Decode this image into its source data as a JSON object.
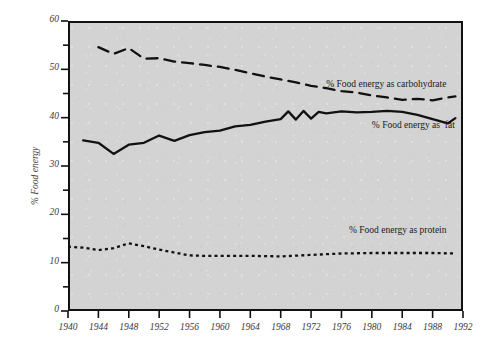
{
  "chart_data": {
    "type": "line",
    "title": "",
    "xlabel": "",
    "ylabel": "% Food energy",
    "xlim": [
      1940,
      1992
    ],
    "ylim": [
      0,
      60
    ],
    "grid": false,
    "legend_position": "inline-annotations",
    "x_ticks": [
      1940,
      1944,
      1948,
      1952,
      1956,
      1960,
      1964,
      1968,
      1972,
      1976,
      1980,
      1984,
      1988,
      1992
    ],
    "x_tick_labels": [
      "1940",
      "1944",
      "1948",
      "1952",
      "1956",
      "1960",
      "1964",
      "1968",
      "1972",
      "1976",
      "1980",
      "1984",
      "1988",
      "1992"
    ],
    "y_ticks": [
      0,
      10,
      20,
      30,
      40,
      50,
      60
    ],
    "y_tick_labels": [
      "0",
      "10",
      "20",
      "30",
      "40",
      "50",
      "60"
    ],
    "y_minor_ticks": [
      5,
      15,
      25,
      35,
      45,
      55
    ],
    "series": [
      {
        "name": "% Food energy as carbohydrate",
        "style": "dashed",
        "color": "#111111",
        "x": [
          1944,
          1946,
          1948,
          1950,
          1952,
          1954,
          1956,
          1958,
          1960,
          1962,
          1964,
          1966,
          1968,
          1970,
          1972,
          1974,
          1976,
          1978,
          1980,
          1982,
          1984,
          1986,
          1988,
          1990,
          1991
        ],
        "values": [
          54.6,
          53.2,
          54.4,
          52.2,
          52.3,
          51.6,
          51.3,
          50.9,
          50.5,
          49.9,
          49.2,
          48.5,
          47.9,
          47.3,
          46.6,
          46.1,
          45.5,
          45.2,
          44.6,
          44.2,
          43.7,
          43.9,
          43.6,
          44.2,
          44.4
        ]
      },
      {
        "name": "% Food energy as  fat",
        "style": "solid",
        "color": "#111111",
        "x": [
          1942,
          1944,
          1946,
          1948,
          1950,
          1952,
          1954,
          1956,
          1958,
          1960,
          1962,
          1964,
          1966,
          1968,
          1969,
          1970,
          1971,
          1972,
          1973,
          1974,
          1976,
          1978,
          1980,
          1982,
          1984,
          1986,
          1988,
          1990,
          1991
        ],
        "values": [
          35.3,
          34.8,
          32.5,
          34.4,
          34.8,
          36.3,
          35.2,
          36.4,
          37.0,
          37.3,
          38.2,
          38.5,
          39.2,
          39.7,
          41.3,
          39.6,
          41.4,
          39.8,
          41.2,
          40.9,
          41.3,
          41.1,
          41.2,
          41.4,
          41.2,
          40.6,
          39.7,
          38.8,
          39.9
        ]
      },
      {
        "name": "% Food energy as protein",
        "style": "dotted",
        "color": "#111111",
        "x": [
          1940,
          1942,
          1944,
          1946,
          1948,
          1950,
          1952,
          1954,
          1956,
          1958,
          1960,
          1964,
          1968,
          1972,
          1976,
          1980,
          1984,
          1988,
          1991
        ],
        "values": [
          13.3,
          13.1,
          12.6,
          13.0,
          14.0,
          13.4,
          12.7,
          12.1,
          11.5,
          11.4,
          11.4,
          11.4,
          11.3,
          11.6,
          11.9,
          12.0,
          12.0,
          12.0,
          11.9
        ]
      }
    ],
    "annotations": [
      {
        "text": "% Food energy as carbohydrate",
        "x": 1974,
        "y": 46.5
      },
      {
        "text": "% Food energy as  fat",
        "x": 1980,
        "y": 38.0
      },
      {
        "text": "% Food energy as protein",
        "x": 1977,
        "y": 16.4
      }
    ]
  }
}
